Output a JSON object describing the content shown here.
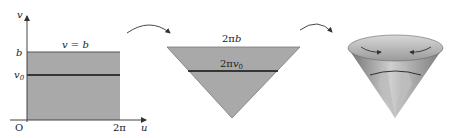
{
  "figure": {
    "panels": [
      {
        "id": "rectangle-domain",
        "axes": {
          "x_label": "u",
          "y_label": "v",
          "origin_label": "O"
        },
        "ticks": {
          "x_end": "2π",
          "y_top": "b",
          "y_mid": "v₀"
        },
        "top_edge_label": "v = b"
      },
      {
        "id": "flattened-sector",
        "top_label": "2πb",
        "mid_label": "2πv₀"
      },
      {
        "id": "cone",
        "description": "sector rolled into a cone with curved arrows showing the edges being joined"
      }
    ],
    "arrows": [
      "rectangle-to-sector",
      "sector-to-cone"
    ],
    "colors": {
      "fill": "#a9a9a9",
      "line": "#1a1a1a",
      "axis": "#444444"
    }
  }
}
